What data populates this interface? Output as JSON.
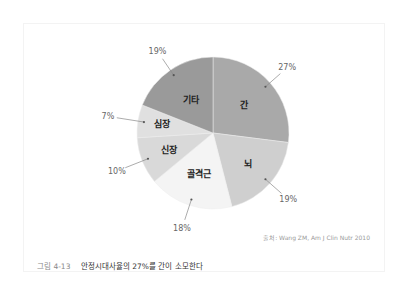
{
  "chart_data": {
    "type": "pie",
    "title": "안정시대사율의 27%를 간이 소모한다",
    "figure_number": "그림 4-13",
    "start_angle": "12 o'clock, clockwise",
    "categories": [
      "간",
      "뇌",
      "골격근",
      "신장",
      "심장",
      "기타"
    ],
    "values": [
      27,
      19,
      18,
      10,
      7,
      19
    ],
    "value_labels": [
      "27%",
      "19%",
      "18%",
      "10%",
      "7%",
      "19%"
    ],
    "colors": [
      "#a9a9a9",
      "#cfcfcf",
      "#f4f4f4",
      "#d9d9d9",
      "#e0e0e0",
      "#9a9a9a"
    ],
    "unit": "%",
    "legend": "none (labels inside slices)",
    "source": "출처: Wang ZM, Am J Clin Nutr 2010"
  },
  "caption": {
    "number": "그림 4-13",
    "text": "안정시대사율의 27%를 간이 소모한다"
  },
  "source_note": "출처: Wang ZM, Am J Clin Nutr 2010"
}
